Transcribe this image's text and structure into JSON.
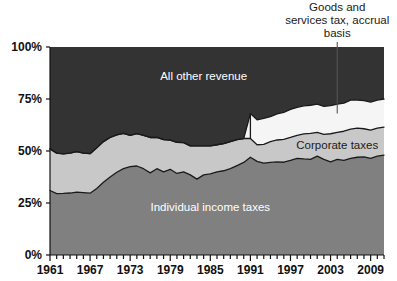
{
  "chart_data": {
    "type": "area",
    "stacked": true,
    "normalized_percent": true,
    "title": "",
    "subtitle": "",
    "xlabel": "",
    "ylabel": "",
    "xlim": [
      1961,
      2011
    ],
    "ylim": [
      0,
      100
    ],
    "grid": false,
    "legend_position": "inline-annotations",
    "y_tick_labels": [
      "0%",
      "25%",
      "50%",
      "75%",
      "100%"
    ],
    "y_ticks": [
      0,
      25,
      50,
      75,
      100
    ],
    "x_tick_labels": [
      "1961",
      "1967",
      "1973",
      "1979",
      "1985",
      "1991",
      "1997",
      "2003",
      "2009"
    ],
    "x_ticks": [
      1961,
      1967,
      1973,
      1979,
      1985,
      1991,
      1997,
      2003,
      2009
    ],
    "x_minor_tick_interval": 1,
    "x": [
      1961,
      1962,
      1963,
      1964,
      1965,
      1966,
      1967,
      1968,
      1969,
      1970,
      1971,
      1972,
      1973,
      1974,
      1975,
      1976,
      1977,
      1978,
      1979,
      1980,
      1981,
      1982,
      1983,
      1984,
      1985,
      1986,
      1987,
      1988,
      1989,
      1990,
      1991,
      1992,
      1993,
      1994,
      1995,
      1996,
      1997,
      1998,
      1999,
      2000,
      2001,
      2002,
      2003,
      2004,
      2005,
      2006,
      2007,
      2008,
      2009,
      2010,
      2011
    ],
    "series": [
      {
        "name": "Individual income taxes",
        "color": "#808080",
        "label_color": "#ffffff",
        "values": [
          31.0,
          29.5,
          29.6,
          29.8,
          30.2,
          30.0,
          29.7,
          32.0,
          35.0,
          37.5,
          39.8,
          41.5,
          42.5,
          42.8,
          41.5,
          39.5,
          41.5,
          40.0,
          41.2,
          39.2,
          40.0,
          38.5,
          36.5,
          38.5,
          39.0,
          40.0,
          40.5,
          41.5,
          43.0,
          44.5,
          47.0,
          45.0,
          44.2,
          44.5,
          44.8,
          44.6,
          45.5,
          46.5,
          46.2,
          46.0,
          47.5,
          46.0,
          44.8,
          46.0,
          45.5,
          46.5,
          47.0,
          47.2,
          46.5,
          47.5,
          48.0
        ]
      },
      {
        "name": "Corporate taxes",
        "color": "#c8c8c8",
        "label_color": "#1a1a1a",
        "values": [
          20.0,
          19.5,
          19.0,
          19.2,
          19.5,
          19.0,
          19.0,
          19.5,
          19.5,
          19.0,
          18.0,
          17.0,
          15.0,
          15.5,
          16.0,
          17.0,
          15.0,
          15.5,
          14.0,
          15.0,
          14.0,
          14.0,
          16.0,
          14.0,
          13.5,
          13.0,
          13.0,
          13.0,
          12.5,
          11.5,
          9.0,
          8.0,
          9.0,
          10.0,
          10.5,
          11.0,
          11.0,
          11.0,
          12.0,
          12.5,
          11.5,
          12.0,
          13.5,
          13.0,
          14.0,
          14.0,
          14.0,
          13.5,
          13.5,
          13.5,
          13.5
        ]
      },
      {
        "name": "Goods and services tax, accrual basis",
        "color": "#f5f5f5",
        "label_color": "#1a1a1a",
        "values": [
          0,
          0,
          0,
          0,
          0,
          0,
          0,
          0,
          0,
          0,
          0,
          0,
          0,
          0,
          0,
          0,
          0,
          0,
          0,
          0,
          0,
          0,
          0,
          0,
          0,
          0,
          0,
          0,
          0,
          0,
          12.0,
          12.0,
          12.5,
          12.0,
          12.5,
          13.0,
          13.5,
          13.5,
          13.5,
          13.5,
          13.5,
          13.5,
          13.5,
          13.5,
          13.5,
          14.0,
          13.5,
          13.5,
          13.5,
          13.5,
          13.5
        ]
      },
      {
        "name": "All other revenue",
        "color": "#333333",
        "label_color": "#ffffff",
        "values": [
          49.0,
          51.0,
          51.4,
          51.0,
          50.3,
          51.0,
          51.3,
          48.5,
          45.5,
          43.5,
          42.2,
          41.5,
          42.5,
          41.7,
          42.5,
          43.5,
          43.5,
          44.5,
          44.8,
          45.8,
          46.0,
          47.5,
          47.5,
          47.5,
          47.5,
          47.0,
          46.5,
          45.5,
          44.5,
          44.0,
          32.0,
          35.0,
          34.3,
          33.5,
          32.2,
          31.4,
          30.0,
          29.0,
          28.3,
          28.0,
          27.5,
          28.5,
          28.2,
          27.5,
          27.0,
          25.5,
          25.5,
          25.8,
          26.5,
          25.5,
          25.0
        ]
      }
    ],
    "annotations": [
      {
        "id": "gst-callout",
        "text_lines": [
          "Goods and",
          "services tax, accrual",
          "basis"
        ],
        "leader_year": 2004,
        "leader_value": 68
      }
    ],
    "inline_labels": [
      {
        "id": "all-other-revenue-label",
        "text": "All other revenue",
        "year": 1984,
        "value": 84,
        "color": "#ffffff"
      },
      {
        "id": "corporate-taxes-label",
        "text": "Corporate taxes",
        "year": 2004,
        "value": 51,
        "color": "#1a1a1a"
      },
      {
        "id": "individual-income-taxes-label",
        "text": "Individual income taxes",
        "year": 1985,
        "value": 21,
        "color": "#ffffff"
      }
    ]
  }
}
